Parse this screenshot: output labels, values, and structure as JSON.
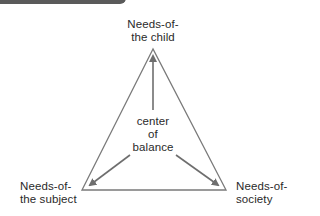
{
  "header": {
    "title": ""
  },
  "diagram": {
    "top_node": {
      "line1": "Needs-of-",
      "line2": "the child"
    },
    "center_node": {
      "line1": "center",
      "line2": "of",
      "line3": "balance"
    },
    "left_node": {
      "line1": "Needs-of-",
      "line2": "the subject"
    },
    "right_node": {
      "line1": "Needs-of-",
      "line2": "society"
    },
    "colors": {
      "line": "#7a7a7a",
      "arrow": "#6e6e6e",
      "text": "#2a2a2a",
      "header": "#5a5a5a"
    }
  }
}
